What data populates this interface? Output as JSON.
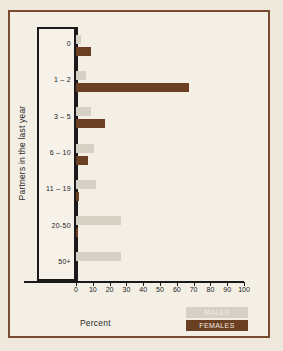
{
  "chart_data": {
    "type": "bar",
    "orientation": "horizontal",
    "title": "",
    "xlabel": "Percent",
    "ylabel": "Partners in the last year",
    "xlim": [
      0,
      100
    ],
    "grid": false,
    "legend_position": "bottom-right",
    "xticks": [
      0,
      10,
      20,
      30,
      40,
      50,
      60,
      70,
      80,
      90,
      100
    ],
    "xtick_labels": [
      "0",
      "10",
      "20",
      "30",
      "40",
      "50",
      "60",
      "70",
      "80",
      "90",
      "100"
    ],
    "categories": [
      "0",
      "1 – 2",
      "3 – 5",
      "6 – 10",
      "11 – 19",
      "20-50",
      "50+"
    ],
    "series": [
      {
        "name": "MALES",
        "color": "#d6d1c4",
        "values": [
          3,
          6,
          9,
          11,
          12,
          27,
          27
        ]
      },
      {
        "name": "FEMALES",
        "color": "#6b3f22",
        "values": [
          9,
          67,
          17,
          7,
          1.5,
          1,
          0
        ]
      }
    ]
  },
  "legend": {
    "items": [
      {
        "label": "MALES"
      },
      {
        "label": "FEMALES"
      }
    ]
  },
  "colors": {
    "frame": "#7a4b2e",
    "background": "#f4efe5",
    "axis": "#1a1a1a",
    "males": "#d6d1c4",
    "females": "#6b3f22"
  }
}
